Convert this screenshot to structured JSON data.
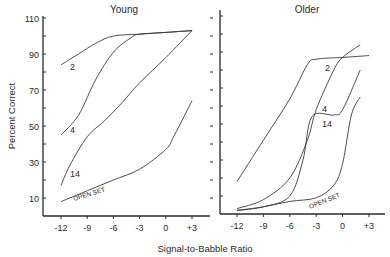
{
  "chart_data": [
    {
      "type": "line",
      "title": "Young",
      "xlabel": "Signal-to-Babble Ratio",
      "ylabel": "Percent Correct",
      "xticks": [
        "-12",
        "-9",
        "-6",
        "-3",
        "0",
        "+3"
      ],
      "yticks": [
        "10",
        "30",
        "50",
        "70",
        "90",
        "110"
      ],
      "xlim": [
        -12,
        3
      ],
      "ylim": [
        0,
        110
      ],
      "grid": false,
      "series": [
        {
          "name": "2",
          "x": [
            -12,
            -10,
            -8,
            -6,
            -3,
            0,
            3
          ],
          "y": [
            84,
            90,
            96,
            100,
            101,
            102,
            103
          ]
        },
        {
          "name": "4",
          "x": [
            -12,
            -10,
            -8,
            -6,
            -4,
            -3,
            0,
            3
          ],
          "y": [
            45,
            56,
            76,
            91,
            99,
            101,
            102,
            103
          ]
        },
        {
          "name": "14",
          "x": [
            -12,
            -11,
            -9,
            -7,
            -5,
            -3,
            0,
            3
          ],
          "y": [
            17,
            28,
            44,
            53,
            63,
            74,
            88,
            103
          ]
        },
        {
          "name": "OPEN SET",
          "x": [
            -12,
            -9,
            -6,
            -3,
            0,
            1,
            3
          ],
          "y": [
            8,
            14,
            20,
            26,
            37,
            45,
            64
          ]
        }
      ]
    },
    {
      "type": "line",
      "title": "Older",
      "xlabel": "Signal-to-Babble Ratio",
      "ylabel": "Percent Correct",
      "xticks": [
        "-12",
        "-9",
        "-6",
        "-3",
        "0",
        "+3"
      ],
      "yticks": [
        "10",
        "30",
        "50",
        "70",
        "90",
        "110"
      ],
      "xlim": [
        -12,
        3
      ],
      "ylim": [
        0,
        110
      ],
      "grid": false,
      "series": [
        {
          "name": "2",
          "x": [
            -12,
            -9,
            -6,
            -4,
            -3,
            0,
            3
          ],
          "y": [
            18,
            41,
            64,
            83,
            86,
            87,
            88
          ]
        },
        {
          "name": "4",
          "x": [
            -12,
            -9,
            -6,
            -4,
            -3,
            -1,
            0,
            2
          ],
          "y": [
            3,
            8,
            20,
            41,
            58,
            80,
            87,
            94
          ]
        },
        {
          "name": "14",
          "x": [
            -12,
            -9,
            -6,
            -4.5,
            -3.5,
            -1,
            0,
            2
          ],
          "y": [
            2,
            4,
            10,
            30,
            54,
            55,
            58,
            80
          ]
        },
        {
          "name": "OPEN SET",
          "x": [
            -12,
            -9,
            -6,
            -3,
            -1,
            0,
            1,
            2
          ],
          "y": [
            2,
            4,
            7,
            9,
            16,
            28,
            55,
            65
          ]
        }
      ]
    }
  ],
  "labels": {
    "young_title": "Young",
    "older_title": "Older",
    "ylabel": "Percent Correct",
    "xlabel": "Signal-to-Babble Ratio",
    "left_yticks": [
      "110",
      "90",
      "70",
      "50",
      "30",
      "10"
    ],
    "xticks": [
      "-12",
      "-9",
      "-6",
      "-3",
      "0",
      "+3"
    ],
    "curve_labels": {
      "two": "2",
      "four": "4",
      "fourteen": "14",
      "open_set": "OPEN SET"
    }
  }
}
